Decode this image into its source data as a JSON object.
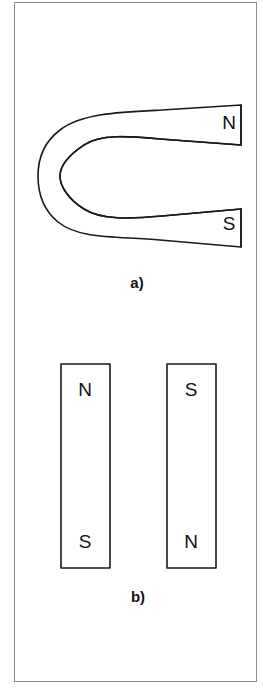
{
  "figure": {
    "background_color": "#ffffff",
    "frame_color": "#8d8d8d",
    "ink_color": "#1a1a1a"
  },
  "panels": [
    {
      "id": "a",
      "label": "a)",
      "caption_x": 137,
      "caption_y": 283,
      "magnet_type": "horseshoe-magnet",
      "poles": [
        {
          "name": "north-pole",
          "label": "N",
          "x": 229,
          "y": 123
        },
        {
          "name": "south-pole",
          "label": "S",
          "x": 229,
          "y": 224
        }
      ]
    },
    {
      "id": "b",
      "label": "b)",
      "caption_x": 138,
      "caption_y": 597,
      "magnet_type": "bar-magnets",
      "bars": [
        {
          "name": "left-bar-magnet",
          "x": 61,
          "y": 364,
          "width": 49,
          "height": 204,
          "top_pole": {
            "name": "north-pole",
            "label": "N",
            "x": 85,
            "y": 390
          },
          "bottom_pole": {
            "name": "south-pole",
            "label": "S",
            "x": 85,
            "y": 542
          }
        },
        {
          "name": "right-bar-magnet",
          "x": 167,
          "y": 364,
          "width": 49,
          "height": 204,
          "top_pole": {
            "name": "south-pole",
            "label": "S",
            "x": 191,
            "y": 390
          },
          "bottom_pole": {
            "name": "north-pole",
            "label": "N",
            "x": 191,
            "y": 542
          }
        }
      ]
    }
  ]
}
